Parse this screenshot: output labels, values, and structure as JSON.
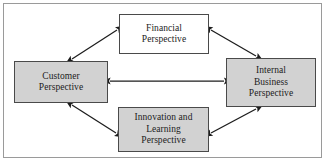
{
  "diagram": {
    "frame": {
      "border_color": "#9a9a9a",
      "background": "#ffffff"
    },
    "colors": {
      "node_fill_gray": "#d2d2d2",
      "node_fill_white": "#ffffff",
      "node_border": "#4a4a4a",
      "arrow": "#1c1c1c",
      "text": "#1c1c1c"
    },
    "nodes": [
      {
        "id": "financial",
        "label": "Financial\nPerspective",
        "lines": [
          "Financial",
          "Perspective"
        ],
        "fill": "white"
      },
      {
        "id": "customer",
        "label": "Customer\nPerspective",
        "lines": [
          "Customer",
          "Perspective"
        ],
        "fill": "gray"
      },
      {
        "id": "internal-business",
        "label": "Internal\nBusiness\nPerspective",
        "lines": [
          "Internal",
          "Business",
          "Perspective"
        ],
        "fill": "gray"
      },
      {
        "id": "innovation-learning",
        "label": "Innovation and\nLearning\nPerspective",
        "lines": [
          "Innovation and",
          "Learning",
          "Perspective"
        ],
        "fill": "gray"
      }
    ],
    "connectors": [
      {
        "id": "customer-financial",
        "from": "customer",
        "to": "financial",
        "style": "double-arrow",
        "orientation": "diagonal"
      },
      {
        "id": "financial-internal",
        "from": "financial",
        "to": "internal-business",
        "style": "double-arrow",
        "orientation": "diagonal"
      },
      {
        "id": "customer-internal",
        "from": "customer",
        "to": "internal-business",
        "style": "double-arrow",
        "orientation": "horizontal"
      },
      {
        "id": "customer-innovation",
        "from": "customer",
        "to": "innovation-learning",
        "style": "double-arrow",
        "orientation": "diagonal"
      },
      {
        "id": "innovation-internal",
        "from": "innovation-learning",
        "to": "internal-business",
        "style": "double-arrow",
        "orientation": "diagonal"
      }
    ]
  }
}
